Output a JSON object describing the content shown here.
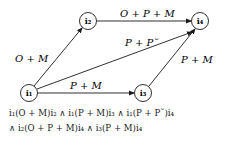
{
  "diagram": {
    "nodes": [
      {
        "id": "i1",
        "label": "i₁",
        "x": 29,
        "y": 93
      },
      {
        "id": "i2",
        "label": "i₂",
        "x": 88,
        "y": 21
      },
      {
        "id": "i3",
        "label": "i₃",
        "x": 143,
        "y": 93
      },
      {
        "id": "i4",
        "label": "i₄",
        "x": 200,
        "y": 21
      }
    ],
    "edges": [
      {
        "from": "i1",
        "to": "i2",
        "label": "O + M"
      },
      {
        "from": "i2",
        "to": "i4",
        "label": "O + P + M"
      },
      {
        "from": "i1",
        "to": "i4",
        "label": "P + P˘"
      },
      {
        "from": "i1",
        "to": "i3",
        "label": "P + M"
      },
      {
        "from": "i3",
        "to": "i4",
        "label": "P + M"
      }
    ]
  },
  "formula": {
    "line1": "i₁(O + M)i₂  ∧  i₁(P + M)i₃  ∧  i₁(P + P˘)i₄",
    "line2": "∧ i₂(O + P + M)i₄  ∧  i₃(P + M)i₄"
  }
}
